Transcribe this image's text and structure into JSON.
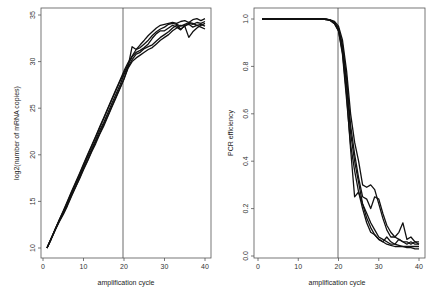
{
  "chart_data": [
    {
      "type": "line",
      "title": "",
      "xlabel": "amplification cycle",
      "ylabel": "log2(number of mRNA copies)",
      "xlim": [
        0,
        41
      ],
      "ylim": [
        9.3,
        35.5
      ],
      "xticks": [
        0,
        10,
        20,
        30,
        40
      ],
      "yticks": [
        10,
        15,
        20,
        25,
        30,
        35
      ],
      "grid": false,
      "legend": null,
      "annotations": [
        {
          "type": "vline",
          "x": 20
        }
      ],
      "x": [
        1,
        2,
        3,
        4,
        5,
        6,
        7,
        8,
        9,
        10,
        11,
        12,
        13,
        14,
        15,
        16,
        17,
        18,
        19,
        20,
        21,
        22,
        23,
        24,
        25,
        26,
        27,
        28,
        29,
        30,
        31,
        32,
        33,
        34,
        35,
        36,
        37,
        38,
        39,
        40
      ],
      "series": [
        {
          "name": "run 1",
          "values": [
            10,
            11,
            12,
            13,
            14,
            15,
            16,
            17,
            18,
            19,
            20,
            21,
            22,
            23,
            24,
            25,
            26,
            27,
            28,
            29,
            29.9,
            30.6,
            31.3,
            31.8,
            32.3,
            32.8,
            33.2,
            33.6,
            33.9,
            34.0,
            34.1,
            34.2,
            34.1,
            34.3,
            34.4,
            34.2,
            34.5,
            34.6,
            34.4,
            34.6
          ]
        },
        {
          "name": "run 2",
          "values": [
            10,
            10.9,
            11.9,
            12.9,
            13.9,
            14.8,
            15.8,
            16.8,
            17.7,
            18.7,
            19.7,
            20.6,
            21.6,
            22.6,
            23.5,
            24.5,
            25.5,
            26.5,
            27.5,
            28.6,
            29.5,
            31.6,
            31.3,
            31.5,
            31.9,
            32.3,
            32.8,
            33.2,
            33.5,
            33.7,
            34.0,
            34.1,
            34.0,
            33.8,
            34.0,
            34.2,
            34.1,
            33.9,
            33.7,
            33.5
          ]
        },
        {
          "name": "run 3",
          "values": [
            10,
            11,
            12,
            12.9,
            13.7,
            14.6,
            15.6,
            16.5,
            17.5,
            18.5,
            19.4,
            20.4,
            21.4,
            22.3,
            23.3,
            24.2,
            25.2,
            26.2,
            27.2,
            28.2,
            29.4,
            30.2,
            30.8,
            31.0,
            31.4,
            31.6,
            31.8,
            32.2,
            32.6,
            32.9,
            33.2,
            33.6,
            33.9,
            33.5,
            33.8,
            34.1,
            34.0,
            34.2,
            34.1,
            34.3
          ]
        },
        {
          "name": "run 4",
          "values": [
            10,
            11,
            11.9,
            12.8,
            13.6,
            14.5,
            15.5,
            16.5,
            17.4,
            18.4,
            19.3,
            20.3,
            21.2,
            22.2,
            23.1,
            24.1,
            25.1,
            26.1,
            27.1,
            28.1,
            29.3,
            30.0,
            30.4,
            30.7,
            31.0,
            31.3,
            31.5,
            31.9,
            32.3,
            32.6,
            32.9,
            33.3,
            33.6,
            33.9,
            33.8,
            32.6,
            33.2,
            33.6,
            33.9,
            34.1
          ]
        },
        {
          "name": "run 5",
          "values": [
            10,
            11,
            12,
            13,
            13.9,
            14.9,
            15.9,
            16.9,
            17.9,
            18.9,
            19.9,
            20.9,
            21.9,
            22.9,
            23.9,
            24.9,
            25.9,
            26.9,
            27.9,
            28.8,
            29.7,
            30.5,
            31.0,
            31.2,
            31.5,
            31.9,
            32.5,
            33.0,
            33.3,
            33.3,
            33.6,
            33.9,
            33.7,
            33.4,
            33.9,
            34.0,
            33.7,
            33.9,
            34.0,
            33.8
          ]
        }
      ]
    },
    {
      "type": "line",
      "title": "",
      "xlabel": "amplification cycle",
      "ylabel": "PCR efficiency",
      "xlim": [
        0,
        41
      ],
      "ylim": [
        -0.02,
        1.03
      ],
      "xticks": [
        0,
        10,
        20,
        30,
        40
      ],
      "yticks": [
        0.0,
        0.2,
        0.4,
        0.6,
        0.8,
        1.0
      ],
      "ytick_labels": [
        "0.0",
        "0.2",
        "0.4",
        "0.6",
        "0.8",
        "1.0"
      ],
      "grid": false,
      "legend": null,
      "annotations": [
        {
          "type": "vline",
          "x": 20
        }
      ],
      "x": [
        1,
        2,
        3,
        4,
        5,
        6,
        7,
        8,
        9,
        10,
        11,
        12,
        13,
        14,
        15,
        16,
        17,
        18,
        19,
        20,
        21,
        22,
        23,
        24,
        25,
        26,
        27,
        28,
        29,
        30,
        31,
        32,
        33,
        34,
        35,
        36,
        37,
        38,
        39,
        40
      ],
      "series": [
        {
          "name": "run 1",
          "values": [
            1,
            1,
            1,
            1,
            1,
            1,
            1,
            1,
            1,
            1,
            1,
            1,
            1,
            1,
            1,
            1,
            0.998,
            0.995,
            0.985,
            0.96,
            0.88,
            0.72,
            0.52,
            0.4,
            0.31,
            0.22,
            0.16,
            0.12,
            0.09,
            0.07,
            0.06,
            0.05,
            0.045,
            0.04,
            0.04,
            0.04,
            0.035,
            0.035,
            0.03,
            0.03
          ]
        },
        {
          "name": "run 2",
          "values": [
            1,
            1,
            1,
            1,
            1,
            1,
            1,
            1,
            1,
            1,
            1,
            1,
            1,
            1,
            1,
            1,
            0.998,
            0.993,
            0.98,
            0.95,
            0.86,
            0.68,
            0.45,
            0.25,
            0.27,
            0.22,
            0.18,
            0.14,
            0.11,
            0.08,
            0.07,
            0.06,
            0.05,
            0.05,
            0.045,
            0.04,
            0.04,
            0.04,
            0.04,
            0.04
          ]
        },
        {
          "name": "run 3",
          "values": [
            1,
            1,
            1,
            1,
            1,
            1,
            1,
            1,
            1,
            1,
            1,
            1,
            1,
            1,
            1,
            1,
            0.999,
            0.996,
            0.99,
            0.97,
            0.91,
            0.78,
            0.6,
            0.48,
            0.4,
            0.3,
            0.29,
            0.3,
            0.28,
            0.22,
            0.16,
            0.11,
            0.08,
            0.08,
            0.1,
            0.14,
            0.07,
            0.08,
            0.06,
            0.06
          ]
        },
        {
          "name": "run 4",
          "values": [
            1,
            1,
            1,
            1,
            1,
            1,
            1,
            1,
            1,
            1,
            1,
            1,
            1,
            1,
            1,
            1,
            0.999,
            0.995,
            0.985,
            0.96,
            0.89,
            0.75,
            0.55,
            0.43,
            0.33,
            0.25,
            0.24,
            0.2,
            0.25,
            0.24,
            0.18,
            0.13,
            0.1,
            0.08,
            0.07,
            0.06,
            0.06,
            0.05,
            0.06,
            0.05
          ]
        },
        {
          "name": "run 5",
          "values": [
            1,
            1,
            1,
            1,
            1,
            1,
            1,
            1,
            1,
            1,
            1,
            1,
            1,
            1,
            1,
            1,
            0.998,
            0.994,
            0.98,
            0.95,
            0.85,
            0.66,
            0.47,
            0.36,
            0.27,
            0.2,
            0.14,
            0.1,
            0.09,
            0.07,
            0.06,
            0.08,
            0.06,
            0.05,
            0.07,
            0.06,
            0.05,
            0.06,
            0.05,
            0.05
          ]
        }
      ]
    }
  ],
  "plots": {
    "left": {
      "ylabel": "log2(number of mRNA copies)",
      "xlabel": "amplification cycle",
      "yticks": [
        "10",
        "15",
        "20",
        "25",
        "30",
        "35"
      ],
      "xticks": [
        "0",
        "10",
        "20",
        "30",
        "40"
      ]
    },
    "right": {
      "ylabel": "PCR efficiency",
      "xlabel": "amplification cycle",
      "yticks": [
        "0.0",
        "0.2",
        "0.4",
        "0.6",
        "0.8",
        "1.0"
      ],
      "xticks": [
        "0",
        "10",
        "20",
        "30",
        "40"
      ]
    }
  }
}
